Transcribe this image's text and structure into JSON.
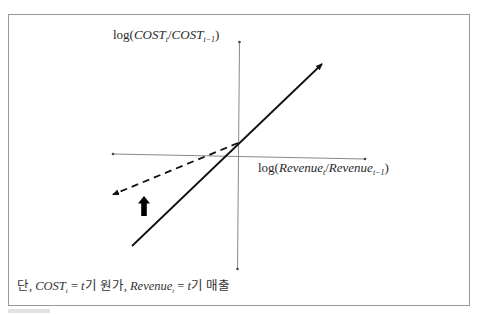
{
  "diagram": {
    "y_axis": {
      "func": "log(",
      "num": "COST",
      "num_sub": "t",
      "sep": "/",
      "den": "COST",
      "den_sub": "t−1",
      "close": ")"
    },
    "x_axis": {
      "func": "log(",
      "num": "Revenue",
      "num_sub": "t",
      "sep": "/",
      "den": "Revenue",
      "den_sub": "t−1",
      "close": ")"
    },
    "footnote": {
      "prefix": "단,",
      "cost": "COST",
      "cost_sub": "t",
      "eq1": " = ",
      "t1": "t",
      "def1": "기 원가,",
      "rev": "Revenue",
      "rev_sub": "t",
      "eq2": " = ",
      "t2": "t",
      "def2": "기 매출"
    },
    "lines": [
      {
        "name": "cost-response-solid",
        "style": "solid",
        "from": [
          132,
          246
        ],
        "to": [
          322,
          64
        ]
      },
      {
        "name": "cost-response-dashed",
        "style": "dashed",
        "from": [
          238,
          143
        ],
        "to": [
          112,
          195
        ]
      }
    ],
    "indicator": {
      "name": "shift-up-arrow",
      "direction": "up"
    },
    "colors": {
      "line": "#111111",
      "axis": "#8a8a8a",
      "frame": "#9a9a9a"
    }
  }
}
